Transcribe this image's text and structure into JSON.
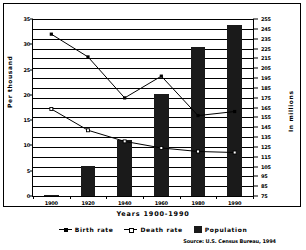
{
  "chart_data": {
    "type": "bar",
    "title": "",
    "xlabel": "Years 1900-1990",
    "ylabel": "Per thousand",
    "ylabel_right": "In millions",
    "categories": [
      "1900",
      "1920",
      "1940",
      "1960",
      "1980",
      "1990"
    ],
    "ylim": [
      0,
      35
    ],
    "ylim_right": [
      75,
      255
    ],
    "yticks": [
      0,
      5,
      10,
      15,
      20,
      25,
      30,
      35
    ],
    "yticks_right": [
      75,
      85,
      95,
      105,
      115,
      125,
      135,
      145,
      155,
      165,
      175,
      185,
      195,
      205,
      215,
      225,
      235,
      245,
      255
    ],
    "grid": true,
    "legend_position": "bottom",
    "series": [
      {
        "name": "Birth rate",
        "type": "line",
        "marker": "filled-square",
        "axis": "left",
        "values": [
          32.0,
          27.5,
          19.4,
          23.7,
          15.9,
          16.7
        ]
      },
      {
        "name": "Death rate",
        "type": "line",
        "marker": "open-square",
        "axis": "left",
        "values": [
          17.2,
          13.0,
          10.8,
          9.5,
          8.8,
          8.6
        ]
      },
      {
        "name": "Population",
        "type": "bar",
        "axis": "right",
        "values": [
          76,
          106,
          132,
          179,
          227,
          249
        ]
      }
    ],
    "annotations": {
      "source": "Source: U.S. Census Bureau, 1994"
    }
  },
  "legend": {
    "items": [
      {
        "label": "Birth rate",
        "marker": "filled-square"
      },
      {
        "label": "Death rate",
        "marker": "open-square"
      },
      {
        "label": "Population",
        "marker": "box"
      }
    ]
  },
  "axes": {
    "left_title": "Per thousand",
    "right_title": "In millions",
    "x_title": "Years 1900-1990"
  },
  "source_note": "Source: U.S. Census Bureau, 1994",
  "colors": {
    "series_line": "#000000",
    "bar_fill": "#1a1a1a",
    "grid": "#000000",
    "background": "#ffffff"
  }
}
